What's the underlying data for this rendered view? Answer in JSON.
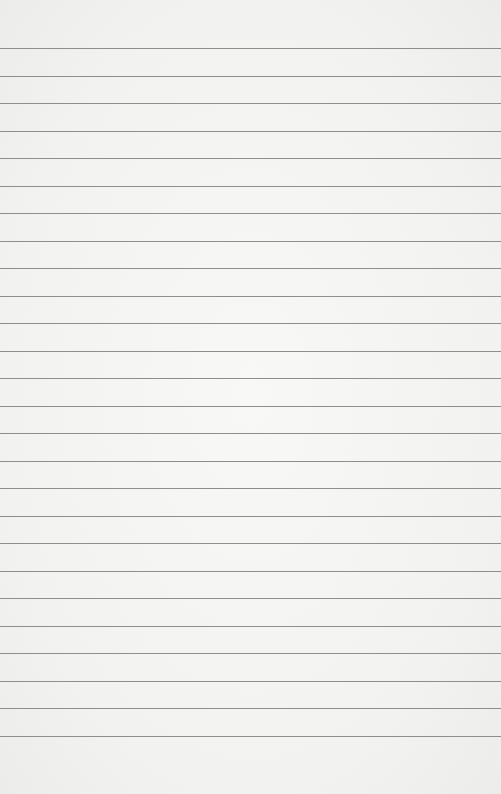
{
  "paper": {
    "type": "lined-paper",
    "background_color": "#f4f4f3",
    "line_color": "#8e8e8e",
    "first_line_y": 48,
    "line_spacing": 27.5,
    "line_count": 26
  }
}
